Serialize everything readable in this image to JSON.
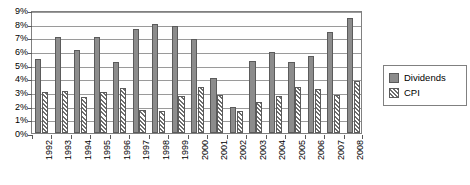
{
  "chart_data": {
    "type": "bar",
    "title": "",
    "subtitle": "",
    "xlabel": "",
    "ylabel": "",
    "categories": [
      "1992",
      "1993",
      "1994",
      "1995",
      "1996",
      "1997",
      "1998",
      "1999",
      "2000",
      "2001",
      "2002",
      "2003",
      "2004",
      "2005",
      "2006",
      "2007",
      "2008"
    ],
    "series": [
      {
        "name": "Dividends",
        "color": "#8c8c8c",
        "values": [
          5.4,
          7.0,
          6.1,
          7.0,
          5.2,
          7.6,
          8.0,
          7.8,
          6.9,
          4.0,
          1.9,
          5.3,
          5.9,
          5.2,
          5.6,
          7.4,
          8.4
        ]
      },
      {
        "name": "CPI",
        "color": "#ffffff",
        "values": [
          3.0,
          3.1,
          2.6,
          3.0,
          3.3,
          1.7,
          1.6,
          2.7,
          3.4,
          2.8,
          1.6,
          2.3,
          2.7,
          3.4,
          3.2,
          2.8,
          3.8
        ]
      }
    ],
    "ylim": [
      0,
      9
    ],
    "ytick_values": [
      0,
      1,
      2,
      3,
      4,
      5,
      6,
      7,
      8,
      9
    ],
    "ytick_labels": [
      "0%",
      "1%",
      "2%",
      "3%",
      "4%",
      "5%",
      "6%",
      "7%",
      "8%",
      "9%"
    ],
    "grid": true,
    "legend_position": "right"
  },
  "legend": {
    "items": [
      {
        "label": "Dividends",
        "swatch": "dividends-swatch"
      },
      {
        "label": "CPI",
        "swatch": "cpi-swatch"
      }
    ]
  }
}
